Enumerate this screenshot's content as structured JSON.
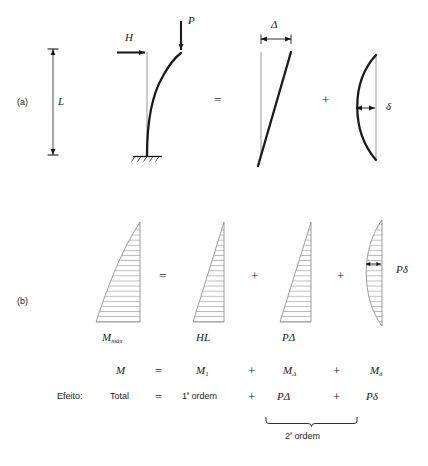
{
  "figure": {
    "panels": [
      {
        "key": "a",
        "label": "(a)"
      },
      {
        "key": "b",
        "label": "(b)"
      }
    ]
  },
  "row_a": {
    "dimension_L": "L",
    "force_H": "H",
    "force_P": "P",
    "delta_cap": "Δ",
    "delta_low": "δ",
    "equals": "=",
    "plus": "+"
  },
  "row_b": {
    "diagram_labels": {
      "total": "M",
      "total_sub": "máx",
      "first_order": "HL",
      "p_delta": "PΔ",
      "p_delta_low": "Pδ"
    },
    "equals": "=",
    "plus_1": "+",
    "plus_2": "+"
  },
  "equation_row": {
    "lhs": "M",
    "equals": "=",
    "term_1_base": "M",
    "term_1_sub": "1",
    "plus_1": "+",
    "term_2_base": "M",
    "term_2_sub": "Δ",
    "plus_2": "+",
    "term_3_base": "M",
    "term_3_sub": "δ"
  },
  "effect_row": {
    "caption": "Efeito:",
    "total": "Total",
    "equals": "=",
    "first_order_num": "1",
    "first_order_ord": "ª",
    "first_order_word": "ordem",
    "plus_1": "+",
    "p_delta": "PΔ",
    "plus_2": "+",
    "p_delta_low": "Pδ"
  },
  "brace": {
    "label_num": "2",
    "label_ord": "ª",
    "label_word": "ordem"
  },
  "colors": {
    "ink": "#1a1a1a",
    "thin_line": "#808080",
    "hatch": "#9a9a9a",
    "background": "#ffffff"
  }
}
